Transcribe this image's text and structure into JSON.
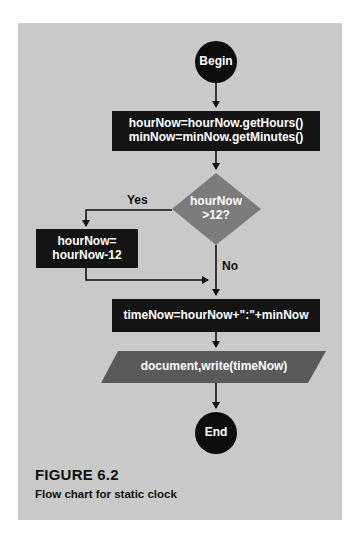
{
  "figure": {
    "number": "FIGURE 6.2",
    "caption": "Flow chart for static clock"
  },
  "colors": {
    "background": "#c9c9c9",
    "terminal": "#0d0d0d",
    "process": "#141414",
    "decision": "#7b7b7b",
    "io": "#5a5a5a",
    "arrow": "#111111"
  },
  "nodes": {
    "begin": {
      "type": "terminal",
      "label": "Begin"
    },
    "get_time": {
      "type": "process",
      "lines": [
        "hourNow=hourNow.getHours()",
        "minNow=minNow.getMinutes()"
      ]
    },
    "decision": {
      "type": "decision",
      "lines": [
        "hourNow",
        ">12?"
      ]
    },
    "subtract": {
      "type": "process",
      "lines": [
        "hourNow=",
        "hourNow-12"
      ]
    },
    "format": {
      "type": "process",
      "label": "timeNow=hourNow+\":\"+minNow"
    },
    "output": {
      "type": "io",
      "label": "document,write(timeNow)"
    },
    "end": {
      "type": "terminal",
      "label": "End"
    }
  },
  "edges": {
    "yes_label": "Yes",
    "no_label": "No"
  }
}
